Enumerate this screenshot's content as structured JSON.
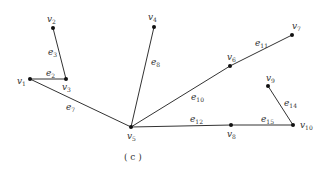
{
  "caption": "( c )",
  "vertices": [
    {
      "id": "v1",
      "base": "v",
      "sub": "1",
      "x": 30,
      "y": 79,
      "lx": 17,
      "ly": 84
    },
    {
      "id": "v2",
      "base": "v",
      "sub": "2",
      "x": 53,
      "y": 28,
      "lx": 47,
      "ly": 22
    },
    {
      "id": "v3",
      "base": "v",
      "sub": "3",
      "x": 66,
      "y": 79,
      "lx": 62,
      "ly": 90
    },
    {
      "id": "v4",
      "base": "v",
      "sub": "4",
      "x": 154,
      "y": 27,
      "lx": 148,
      "ly": 20
    },
    {
      "id": "v5",
      "base": "v",
      "sub": "5",
      "x": 131,
      "y": 127,
      "lx": 127,
      "ly": 139
    },
    {
      "id": "v6",
      "base": "v",
      "sub": "6",
      "x": 230,
      "y": 66,
      "lx": 227,
      "ly": 60
    },
    {
      "id": "v7",
      "base": "v",
      "sub": "7",
      "x": 292,
      "y": 35,
      "lx": 292,
      "ly": 29
    },
    {
      "id": "v8",
      "base": "v",
      "sub": "8",
      "x": 231,
      "y": 125,
      "lx": 227,
      "ly": 137
    },
    {
      "id": "v9",
      "base": "v",
      "sub": "9",
      "x": 268,
      "y": 86,
      "lx": 266,
      "ly": 81
    },
    {
      "id": "v10",
      "base": "v",
      "sub": "10",
      "x": 293,
      "y": 125,
      "lx": 300,
      "ly": 128
    }
  ],
  "edges": [
    {
      "id": "e2",
      "base": "e",
      "sub": "2",
      "from": "v1",
      "to": "v3",
      "lx": 46,
      "ly": 76
    },
    {
      "id": "e3",
      "base": "e",
      "sub": "3",
      "from": "v2",
      "to": "v3",
      "lx": 48,
      "ly": 55
    },
    {
      "id": "e7",
      "base": "e",
      "sub": "7",
      "from": "v1",
      "to": "v5",
      "lx": 66,
      "ly": 110
    },
    {
      "id": "e8",
      "base": "e",
      "sub": "8",
      "from": "v4",
      "to": "v5",
      "lx": 151,
      "ly": 65
    },
    {
      "id": "e10",
      "base": "e",
      "sub": "10",
      "from": "v5",
      "to": "v6",
      "lx": 191,
      "ly": 100
    },
    {
      "id": "e11",
      "base": "e",
      "sub": "11",
      "from": "v6",
      "to": "v7",
      "lx": 255,
      "ly": 46
    },
    {
      "id": "e12",
      "base": "e",
      "sub": "12",
      "from": "v5",
      "to": "v8",
      "lx": 190,
      "ly": 122
    },
    {
      "id": "e14",
      "base": "e",
      "sub": "14",
      "from": "v9",
      "to": "v10",
      "lx": 284,
      "ly": 106
    },
    {
      "id": "e15",
      "base": "e",
      "sub": "15",
      "from": "v8",
      "to": "v10",
      "lx": 261,
      "ly": 122
    }
  ],
  "caption_pos": {
    "x": 124,
    "y": 160
  }
}
